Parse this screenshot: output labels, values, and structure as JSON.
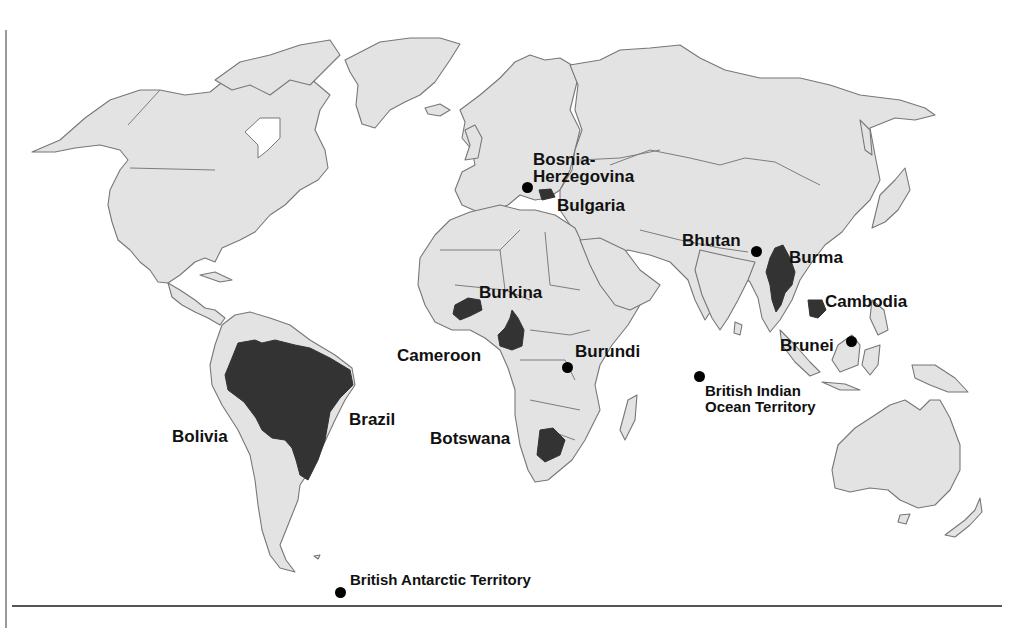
{
  "map": {
    "type": "world-political-outline",
    "colors": {
      "land": "#e3e3e3",
      "outline": "#777777",
      "highlighted_country": "#333333",
      "ocean": "#ffffff",
      "marker": "#000000"
    },
    "labels": {
      "bosnia": "Bosnia-",
      "bosnia_line2": "Herzegovina",
      "bulgaria": "Bulgaria",
      "bhutan": "Bhutan",
      "burma": "Burma",
      "cambodia": "Cambodia",
      "brunei": "Brunei",
      "burkina": "Burkina",
      "cameroon": "Cameroon",
      "burundi": "Burundi",
      "botswana": "Botswana",
      "brazil": "Brazil",
      "bolivia": "Bolivia",
      "biot_line1": "British Indian",
      "biot_line2": "Ocean Territory",
      "bat": "British Antarctic Territory"
    },
    "shaded_countries": [
      "Brazil",
      "Bulgaria",
      "Burma",
      "Cambodia",
      "Burkina",
      "Cameroon",
      "Botswana"
    ],
    "dot_markers": [
      "Bosnia-Herzegovina",
      "Bhutan",
      "Brunei",
      "Burundi",
      "British Indian Ocean Territory",
      "British Antarctic Territory"
    ]
  }
}
